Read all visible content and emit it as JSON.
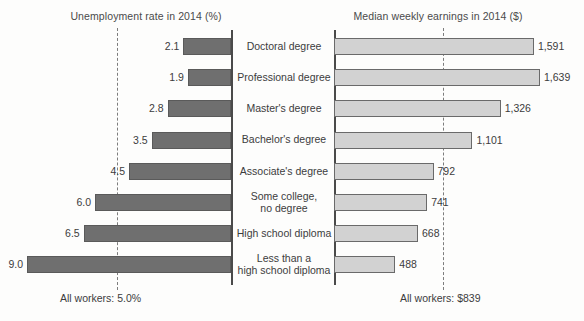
{
  "chart_data": {
    "type": "bar",
    "title": "",
    "orientation": "horizontal",
    "layout": "butterfly-two-panel-shared-categories",
    "categories": [
      "Doctoral degree",
      "Professional degree",
      "Master's degree",
      "Bachelor's degree",
      "Associate's degree",
      "Some college,\nno degree",
      "High school diploma",
      "Less than a\nhigh school diploma"
    ],
    "series": [
      {
        "name": "Unemployment rate in 2014 (%)",
        "panel": "left",
        "direction": "right-to-left",
        "unit": "%",
        "values": [
          2.1,
          1.9,
          2.8,
          3.5,
          4.5,
          6.0,
          6.5,
          9.0
        ],
        "value_labels": [
          "2.1",
          "1.9",
          "2.8",
          "3.5",
          "4.5",
          "6.0",
          "6.5",
          "9.0"
        ],
        "reference_line": 5.0,
        "reference_label": "All workers: 5.0%",
        "axis_max": 9.0,
        "bar_color": "#6f6f6f"
      },
      {
        "name": "Median weekly earnings in 2014 ($)",
        "panel": "right",
        "direction": "left-to-right",
        "unit": "$",
        "values": [
          1591,
          1639,
          1326,
          1101,
          792,
          741,
          668,
          488
        ],
        "value_labels": [
          "1,591",
          "1,639",
          "1,326",
          "1,101",
          "792",
          "741",
          "668",
          "488"
        ],
        "reference_line": 839,
        "reference_label": "All workers: $839",
        "axis_max": 1639,
        "bar_color": "#d2d2d2"
      }
    ],
    "grid": false,
    "legend": "none"
  },
  "panels": {
    "left": {
      "title": "Unemployment rate in 2014 (%)",
      "footnote": "All workers: 5.0%"
    },
    "right": {
      "title": "Median weekly earnings in 2014 ($)",
      "footnote": "All workers: $839"
    }
  },
  "colors": {
    "left_bar": "#6f6f6f",
    "right_bar": "#d2d2d2",
    "axis": "#4a4a4a",
    "dashed": "#7d7d7d",
    "text": "#3c3c3c",
    "background": "#fdfdfc"
  }
}
